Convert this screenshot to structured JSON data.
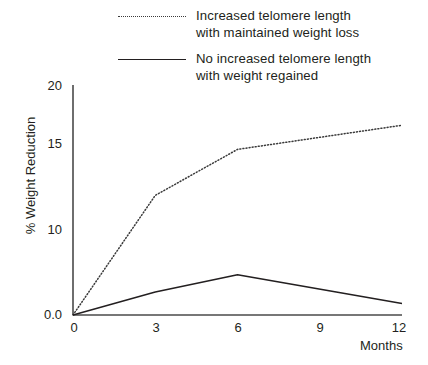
{
  "chart_data": {
    "type": "line",
    "title": "",
    "subtitle": "",
    "xlabel": "Months",
    "ylabel": "% Weight Reduction",
    "x": [
      0,
      3,
      6,
      12
    ],
    "xlim": [
      0,
      12
    ],
    "ylim": [
      0,
      20
    ],
    "xticks": [
      "0",
      "3",
      "6",
      "9",
      "12"
    ],
    "xtick_values": [
      0,
      3,
      6,
      9,
      12
    ],
    "yticks": [
      "0.0",
      "10",
      "15",
      "20"
    ],
    "ytick_values": [
      0,
      10,
      15,
      20
    ],
    "grid": false,
    "legend_position": "top",
    "series": [
      {
        "name": "Increased telomere length\nwith maintained weight loss",
        "style": "dotted",
        "color": "#3a3a3a",
        "x": [
          0,
          3,
          6,
          12
        ],
        "values": [
          0.0,
          10.4,
          14.4,
          16.5
        ]
      },
      {
        "name": "No increased telomere length\nwith weight regained",
        "style": "solid",
        "color": "#231f20",
        "x": [
          0,
          3,
          6,
          12
        ],
        "values": [
          0.0,
          2.0,
          3.5,
          1.0
        ]
      }
    ]
  },
  "legend": {
    "items": [
      {
        "swatch": "dotted-line-swatch",
        "label": "Increased telomere length\nwith maintained weight loss"
      },
      {
        "swatch": "solid-line-swatch",
        "label": "No increased telomere length\nwith weight regained"
      }
    ]
  },
  "axes": {
    "y_axis_label": "% Weight Reduction",
    "x_axis_label": "Months",
    "y_tick_labels": [
      "20",
      "15",
      "10",
      "0.0"
    ],
    "x_tick_labels": [
      "0",
      "3",
      "6",
      "9",
      "12"
    ]
  }
}
